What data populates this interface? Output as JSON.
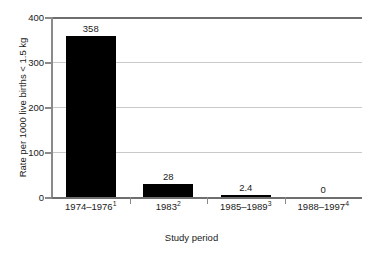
{
  "chart_data": {
    "type": "bar",
    "title": "",
    "xlabel": "Study period",
    "ylabel": "Rate per 1000 live births < 1.5 kg",
    "categories": [
      "1974–1976",
      "1983",
      "1985–1989",
      "1988–1997"
    ],
    "category_footnotes": [
      "1",
      "2",
      "3",
      "4"
    ],
    "values": [
      358,
      28,
      2.4,
      0
    ],
    "value_labels": [
      "358",
      "28",
      "2.4",
      "0"
    ],
    "ylim": [
      0,
      400
    ],
    "yticks": [
      0,
      100,
      200,
      300,
      400
    ],
    "ytick_labels": [
      "0",
      "100",
      "200",
      "300",
      "400"
    ],
    "grid": "horizontal",
    "legend": "none",
    "bar_color": "#000000",
    "gridline_color": "#c9c9c9",
    "axis_color": "#8a8a8a",
    "frame_color": "#6e6e6e"
  }
}
